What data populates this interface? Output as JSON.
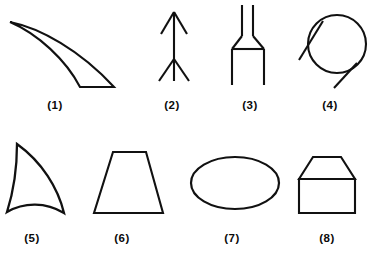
{
  "plate": {
    "title": "Eight line-drawing figures with numbered captions",
    "background_color": "#ffffff",
    "ink_color": "#111111",
    "width": 379,
    "height": 257,
    "rows": 2,
    "columns": 4
  },
  "figures": [
    {
      "number": "1",
      "caption": "(1)",
      "name": "curved-blade",
      "description": "Long tapering crescent blade, sharp point at upper left curving down to a blunt flat tip at lower right",
      "caption_x": 55,
      "caption_y": 100
    },
    {
      "number": "2",
      "caption": "(2)",
      "name": "arrow-up",
      "description": "Vertical arrow pointing upward with an arrowhead at the top and V shaped fletching at the bottom",
      "caption_x": 172,
      "caption_y": 100
    },
    {
      "number": "3",
      "caption": "(3)",
      "name": "fork-connector",
      "description": "Two narrow parallel prongs at the top flaring out at a shoulder into a wider open ended body",
      "caption_x": 250,
      "caption_y": 100
    },
    {
      "number": "4",
      "caption": "(4)",
      "name": "circle-with-tangent-lines",
      "description": "Circle crossed by two short diagonal tangent segments at upper left and lower right",
      "caption_x": 330,
      "caption_y": 100
    },
    {
      "number": "5",
      "caption": "(5)",
      "name": "curved-fin",
      "description": "Shark fin shape, a triangle with three concave curved sides and sharp corners",
      "caption_x": 32,
      "caption_y": 233
    },
    {
      "number": "6",
      "caption": "(6)",
      "name": "trapezoid",
      "description": "Isosceles trapezoid with short top edge and long bottom edge",
      "caption_x": 122,
      "caption_y": 233
    },
    {
      "number": "7",
      "caption": "(7)",
      "name": "ellipse",
      "description": "Wide horizontal ellipse outline",
      "caption_x": 232,
      "caption_y": 233
    },
    {
      "number": "8",
      "caption": "(8)",
      "name": "house-pentagon",
      "description": "Rectangle topped by a trapezoidal cap with a horizontal dividing line between them",
      "caption_x": 327,
      "caption_y": 233
    }
  ]
}
